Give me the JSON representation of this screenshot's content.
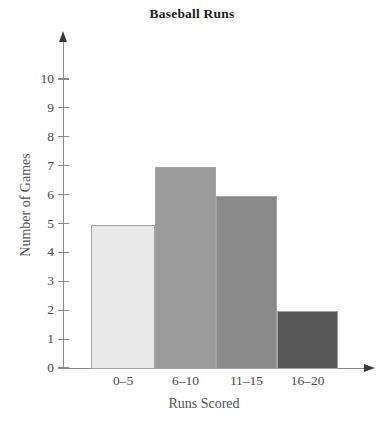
{
  "chart_data": {
    "type": "bar",
    "title": "Baseball Runs",
    "xlabel": "Runs Scored",
    "ylabel": "Number of Games",
    "categories": [
      "0–5",
      "6–10",
      "11–15",
      "16–20"
    ],
    "values": [
      5,
      7,
      6,
      2
    ],
    "ylim": [
      0,
      10
    ],
    "yticks": [
      0,
      1,
      2,
      3,
      4,
      5,
      6,
      7,
      8,
      9,
      10
    ],
    "ytick_labels": [
      "0",
      "1",
      "2",
      "3",
      "4",
      "5",
      "6",
      "7",
      "8",
      "9",
      "10"
    ],
    "grid": false,
    "legend": false,
    "bar_colors": [
      "#e9e9e9",
      "#9b9b9b",
      "#8a8a8a",
      "#585858"
    ],
    "bar_border_color": "#a3a3a3",
    "axis_color": "#8a8a8a",
    "title_color": "#1d1d1d",
    "label_color": "#555555",
    "tick_label_color": "#4a4a4a",
    "bars_adjacent": true
  }
}
